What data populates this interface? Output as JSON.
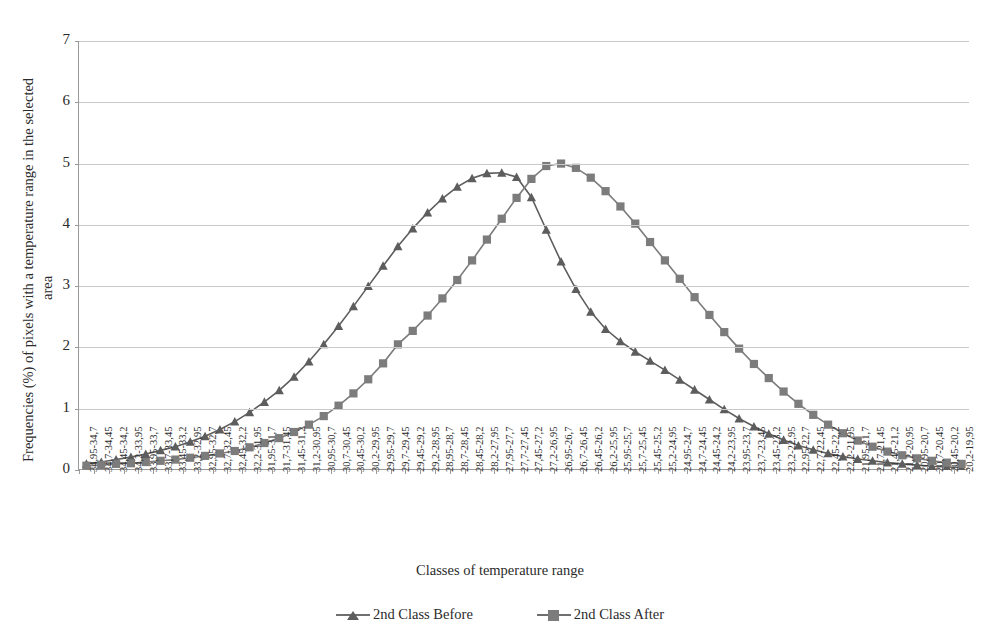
{
  "chart_data": {
    "type": "line",
    "title": "",
    "xlabel": "Classes of temperature range",
    "ylabel": "Frequencies (%) of pixels with a temperature range in the selected area",
    "ylabel_line1": "Frequencies (%) of pixels with a temperature range in the selected",
    "ylabel_line2": "area",
    "ylim": [
      0,
      7
    ],
    "yticks": [
      0,
      1,
      2,
      3,
      4,
      5,
      6,
      7
    ],
    "grid": true,
    "legend_position": "bottom",
    "categories": [
      "34,95-34,7",
      "34,7-34,45",
      "34,45-34,2",
      "34,2-33,95",
      "33,95-33,7",
      "33,7-33,45",
      "33,45-33,2",
      "33,2-32,95",
      "32,95-32,7",
      "32,7-32,45",
      "32,45-32,2",
      "32,2-31,95",
      "31,95-31,7",
      "31,7-31,45",
      "31,45-31,2",
      "31,2-30,95",
      "30,95-30,7",
      "30,7-30,45",
      "30,45-30,2",
      "30,2-29,95",
      "29,95-29,7",
      "29,7-29,45",
      "29,45-29,2",
      "29,2-28,95",
      "28,95-28,7",
      "28,7-28,45",
      "28,45-28,2",
      "28,2-27,95",
      "27,95-27,7",
      "27,7-27,45",
      "27,45-27,2",
      "27,2-26,95",
      "26,95-26,7",
      "26,7-26,45",
      "26,45-26,2",
      "26,2-25,95",
      "25,95-25,7",
      "25,7-25,45",
      "25,45-25,2",
      "25,2-24,95",
      "24,95-24,7",
      "24,7-24,45",
      "24,45-24,2",
      "24,2-23,95",
      "23,95-23,7",
      "23,7-23,45",
      "23,45-23,2",
      "23,2-22,95",
      "22,95-22,7",
      "22,7-22,45",
      "22,45-22,2",
      "22,2-21,95",
      "21,95-21,7",
      "21,7-21,45",
      "21,45-21,2",
      "21,2-20,95",
      "20,95-20,7",
      "20,7-20,45",
      "20,45-20,2",
      "20,2-19,95"
    ],
    "series": [
      {
        "name": "2nd Class Before",
        "marker": "triangle",
        "color": "#5d5d5d",
        "values": [
          0.1,
          0.13,
          0.17,
          0.21,
          0.26,
          0.32,
          0.38,
          0.46,
          0.55,
          0.66,
          0.79,
          0.94,
          1.11,
          1.3,
          1.52,
          1.77,
          2.05,
          2.35,
          2.67,
          3.0,
          3.33,
          3.65,
          3.94,
          4.2,
          4.43,
          4.62,
          4.76,
          4.84,
          4.85,
          4.78,
          4.45,
          3.92,
          3.4,
          2.95,
          2.58,
          2.3,
          2.1,
          1.93,
          1.78,
          1.63,
          1.47,
          1.31,
          1.15,
          0.99,
          0.84,
          0.71,
          0.59,
          0.49,
          0.4,
          0.33,
          0.27,
          0.22,
          0.18,
          0.15,
          0.12,
          0.1,
          0.08,
          0.06,
          0.05,
          0.04
        ]
      },
      {
        "name": "2nd Class After",
        "marker": "square",
        "color": "#7c7c7c",
        "values": [
          0.07,
          0.08,
          0.1,
          0.11,
          0.13,
          0.15,
          0.17,
          0.2,
          0.23,
          0.27,
          0.31,
          0.37,
          0.44,
          0.52,
          0.62,
          0.74,
          0.88,
          1.05,
          1.25,
          1.48,
          1.74,
          2.05,
          2.27,
          2.52,
          2.8,
          3.1,
          3.42,
          3.76,
          4.1,
          4.44,
          4.75,
          4.96,
          5.0,
          4.93,
          4.77,
          4.55,
          4.3,
          4.02,
          3.72,
          3.42,
          3.12,
          2.82,
          2.53,
          2.25,
          1.98,
          1.73,
          1.5,
          1.28,
          1.08,
          0.9,
          0.74,
          0.6,
          0.48,
          0.38,
          0.3,
          0.24,
          0.19,
          0.15,
          0.12,
          0.1
        ]
      }
    ]
  },
  "axis": {
    "x_title": "Classes of temperature range",
    "y_title_line1": "Frequencies (%) of pixels with a temperature range in the selected",
    "y_title_line2": "area"
  },
  "legend": {
    "items": [
      {
        "label": "2nd Class Before",
        "marker": "triangle"
      },
      {
        "label": "2nd Class After",
        "marker": "square"
      }
    ]
  },
  "colors": {
    "series_before": "#5d5d5d",
    "series_after": "#7c7c7c",
    "grid": "#c9c9c9",
    "axis": "#9a9a9a",
    "text": "#2b2b2b",
    "background": "#ffffff"
  }
}
